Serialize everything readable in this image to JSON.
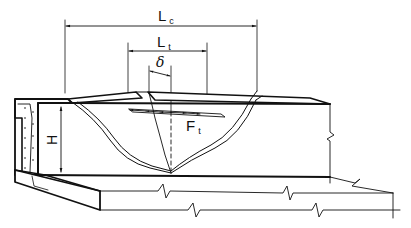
{
  "diagram": {
    "type": "structural-engineering-sketch",
    "colors": {
      "line": "#111111",
      "background": "#ffffff"
    },
    "labels": {
      "lc": {
        "main": "L",
        "sub": "c"
      },
      "lt": {
        "main": "L",
        "sub": "t"
      },
      "delta": "δ",
      "height": "H",
      "force": {
        "main": "F",
        "sub": "t"
      }
    },
    "dimensions": [
      {
        "name": "Lc",
        "meaning": "crack spacing at top (outer crack width)"
      },
      {
        "name": "Lt",
        "meaning": "transfer length"
      },
      {
        "name": "δ",
        "meaning": "offset / slip"
      },
      {
        "name": "H",
        "meaning": "wall height"
      }
    ]
  }
}
